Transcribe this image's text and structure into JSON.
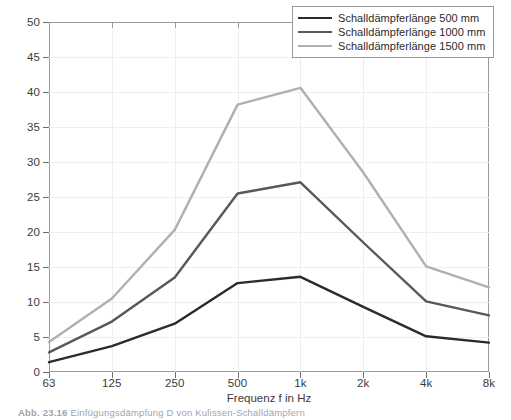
{
  "chart_data": {
    "type": "line",
    "title": "",
    "xlabel": "Frequenz f in Hz",
    "ylabel": "Einfügungsdämpfung D in dB",
    "categories": [
      "63",
      "125",
      "250",
      "500",
      "1k",
      "2k",
      "4k",
      "8k"
    ],
    "xtick_labels": [
      "63",
      "125",
      "250",
      "500",
      "1k",
      "2k",
      "4k",
      "8k"
    ],
    "ytick_labels": [
      "0",
      "5",
      "10",
      "15",
      "20",
      "25",
      "30",
      "35",
      "40",
      "45",
      "50"
    ],
    "ytick_values": [
      0,
      5,
      10,
      15,
      20,
      25,
      30,
      35,
      40,
      45,
      50
    ],
    "ylim": [
      0,
      50
    ],
    "grid": true,
    "legend_position": "top-right",
    "series": [
      {
        "name": "Schalldämpferlänge 500 mm",
        "color": "#2b2b2b",
        "values": [
          1.4,
          3.7,
          6.9,
          12.7,
          13.6,
          9.3,
          5.1,
          4.2
        ]
      },
      {
        "name": "Schalldämpferlänge 1000 mm",
        "color": "#585858",
        "values": [
          2.8,
          7.2,
          13.5,
          25.5,
          27.1,
          18.5,
          10.1,
          8.1
        ]
      },
      {
        "name": "Schalldämpferlänge 1500 mm",
        "color": "#b0b0b0",
        "values": [
          4.3,
          10.5,
          20.3,
          38.2,
          40.6,
          28.5,
          15.1,
          12.1
        ]
      }
    ]
  },
  "legend": {
    "entries": [
      "Schalldämpferlänge 500 mm",
      "Schalldämpferlänge 1000 mm",
      "Schalldämpferlänge 1500 mm"
    ]
  },
  "caption": {
    "number": "Abb. 23.16",
    "text": "Einfügungsdämpfung D von Kulissen-Schalldämpfern"
  }
}
